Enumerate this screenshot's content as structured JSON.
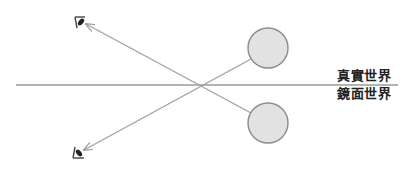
{
  "labels": {
    "real_world": "真實世界",
    "mirror_world": "鏡面世界"
  },
  "colors": {
    "mirror_line": "#9a9a9a",
    "ray": "#a0a0a0",
    "circle_fill": "#e2e2e2",
    "circle_stroke": "#8a8a8a",
    "eye": "#333333"
  },
  "icons": {
    "real_eye": "eye-icon",
    "mirror_eye": "eye-icon",
    "real_object": "circle",
    "mirror_object": "circle"
  }
}
